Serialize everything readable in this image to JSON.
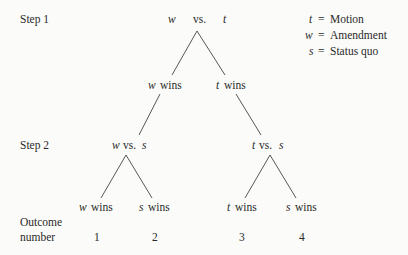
{
  "diagram": {
    "type": "game-tree",
    "step_labels": {
      "step1": "Step 1",
      "step2": "Step 2",
      "outcome_line1": "Outcome",
      "outcome_line2": "number"
    },
    "root": {
      "left": "w",
      "mid": "vs.",
      "right": "t"
    },
    "level1": {
      "left": {
        "var": "w",
        "text": "wins"
      },
      "right": {
        "var": "t",
        "text": "wins"
      }
    },
    "level2": {
      "left": {
        "a": "w",
        "vs": "vs.",
        "b": "s"
      },
      "right": {
        "a": "t",
        "vs": "vs.",
        "b": "s"
      }
    },
    "leaves": [
      {
        "var": "w",
        "text": "wins",
        "outcome": "1"
      },
      {
        "var": "s",
        "text": "wins",
        "outcome": "2"
      },
      {
        "var": "t",
        "text": "wins",
        "outcome": "3"
      },
      {
        "var": "s",
        "text": "wins",
        "outcome": "4"
      }
    ],
    "legend": [
      {
        "var": "t",
        "eq": "=",
        "meaning": "Motion"
      },
      {
        "var": "w",
        "eq": "=",
        "meaning": "Amendment"
      },
      {
        "var": "s",
        "eq": "=",
        "meaning": "Status quo"
      }
    ]
  }
}
